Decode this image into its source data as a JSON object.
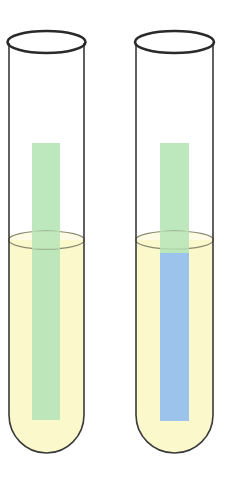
{
  "diagram": {
    "colors": {
      "background": "#ffffff",
      "glass_outline": "#333333",
      "liquid": "#fbf8cc",
      "liquid_surface": "#8a8a70",
      "strip_unreacted": "#b9e6b9",
      "strip_reacted": "#9cc3ec"
    },
    "tubes": [
      {
        "id": "tube-left",
        "strip_state": "unchanged",
        "strip_color_above_liquid": "#b9e6b9",
        "strip_color_in_liquid": "#b9e6b9"
      },
      {
        "id": "tube-right",
        "strip_state": "changed",
        "strip_color_above_liquid": "#b9e6b9",
        "strip_color_in_liquid": "#9cc3ec"
      }
    ]
  }
}
